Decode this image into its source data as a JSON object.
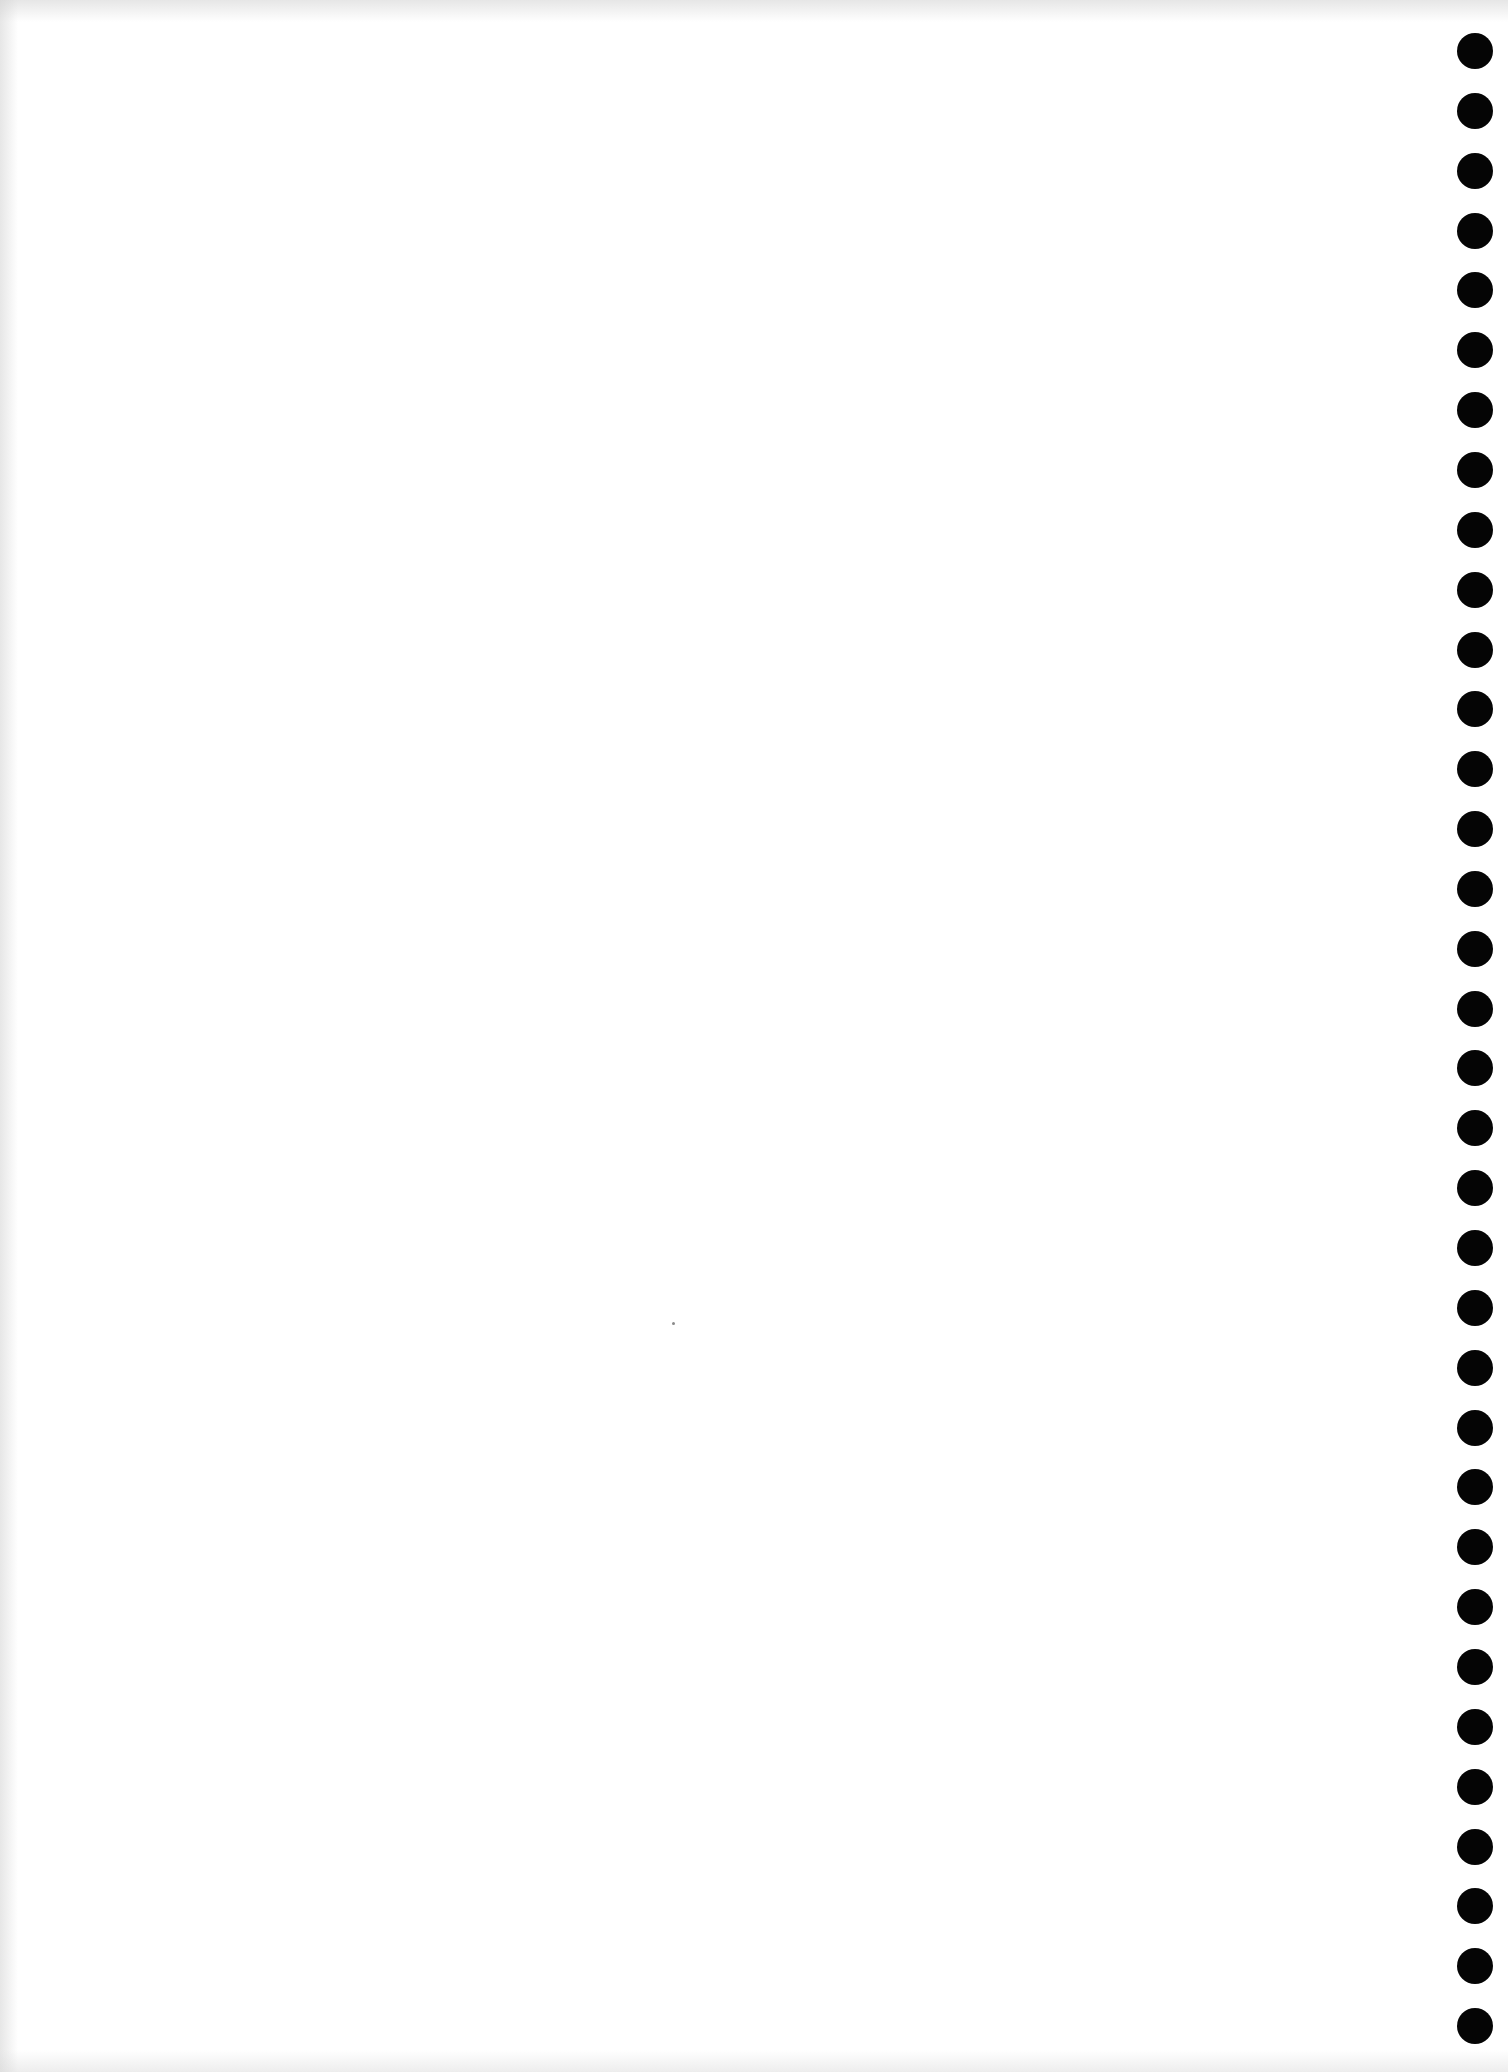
{
  "document": {
    "type": "blank-notebook-page",
    "background_color": "#ffffff",
    "text_content": ""
  },
  "binding_holes": {
    "count": 34,
    "color": "#050505",
    "diameter": 36,
    "center_x": 1475,
    "first_center_y": 51,
    "spacing": 59.85
  },
  "specks": [
    {
      "x": 673,
      "y": 1323
    }
  ]
}
